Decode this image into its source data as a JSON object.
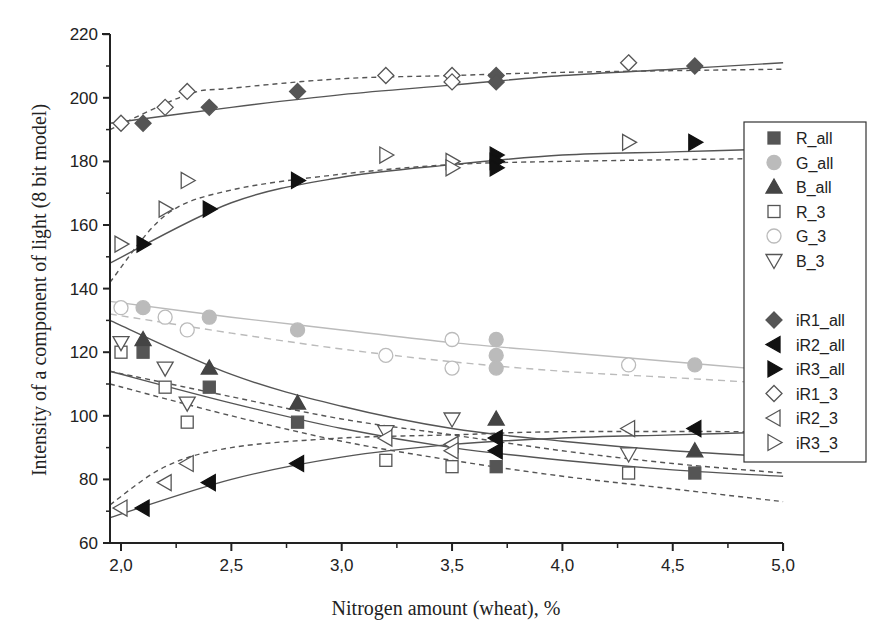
{
  "chart_data": {
    "type": "scatter",
    "title": "",
    "xlabel": "Nitrogen amount (wheat), %",
    "ylabel": "Intensity of a component of light (8 bit model)",
    "xlim": [
      1.95,
      5.0
    ],
    "ylim": [
      60,
      220
    ],
    "x_ticks": [
      "2,0",
      "2,5",
      "3,0",
      "3,5",
      "4,0",
      "4,5",
      "5,0"
    ],
    "x_tick_values": [
      2.0,
      2.5,
      3.0,
      3.5,
      4.0,
      4.5,
      5.0
    ],
    "y_ticks": [
      "60",
      "80",
      "100",
      "120",
      "140",
      "160",
      "180",
      "200",
      "220"
    ],
    "y_tick_values": [
      60,
      80,
      100,
      120,
      140,
      160,
      180,
      200,
      220
    ],
    "grid": false,
    "legend_position": "right",
    "series": [
      {
        "name": "R_all",
        "marker": "square-filled",
        "color": "#555555",
        "fit": "solid",
        "points": [
          [
            2.1,
            120
          ],
          [
            2.4,
            109
          ],
          [
            2.8,
            98
          ],
          [
            3.7,
            84
          ],
          [
            4.6,
            82
          ]
        ],
        "fit_curve": [
          [
            1.95,
            114
          ],
          [
            2.5,
            104
          ],
          [
            3.0,
            96
          ],
          [
            3.5,
            90
          ],
          [
            4.0,
            86
          ],
          [
            4.5,
            83
          ],
          [
            5.0,
            81
          ]
        ]
      },
      {
        "name": "G_all",
        "marker": "circle-filled",
        "color": "#bbbbbb",
        "fit": "solid-light",
        "points": [
          [
            2.1,
            134
          ],
          [
            2.4,
            131
          ],
          [
            2.8,
            127
          ],
          [
            3.7,
            124
          ],
          [
            3.7,
            119
          ],
          [
            3.7,
            115
          ],
          [
            4.6,
            116
          ]
        ],
        "fit_curve": [
          [
            1.95,
            136
          ],
          [
            2.5,
            131
          ],
          [
            3.0,
            127
          ],
          [
            3.5,
            123
          ],
          [
            4.0,
            120
          ],
          [
            4.5,
            117
          ],
          [
            5.0,
            114
          ]
        ]
      },
      {
        "name": "B_all",
        "marker": "triangle-up-filled",
        "color": "#444444",
        "fit": "solid",
        "points": [
          [
            2.1,
            124
          ],
          [
            2.4,
            115
          ],
          [
            2.8,
            104
          ],
          [
            3.7,
            99
          ],
          [
            4.6,
            89
          ]
        ],
        "fit_curve": [
          [
            1.95,
            130
          ],
          [
            2.5,
            113
          ],
          [
            3.0,
            103
          ],
          [
            3.5,
            96
          ],
          [
            4.0,
            92
          ],
          [
            4.5,
            89
          ],
          [
            5.0,
            87
          ]
        ]
      },
      {
        "name": "R_3",
        "marker": "square-open",
        "color": "#555555",
        "fit": "dashed",
        "points": [
          [
            2.0,
            120
          ],
          [
            2.2,
            109
          ],
          [
            2.3,
            98
          ],
          [
            3.2,
            86
          ],
          [
            3.5,
            84
          ],
          [
            4.3,
            82
          ]
        ],
        "fit_curve": [
          [
            1.95,
            110
          ],
          [
            2.5,
            100
          ],
          [
            3.0,
            92
          ],
          [
            3.5,
            86
          ],
          [
            4.0,
            81
          ],
          [
            4.5,
            77
          ],
          [
            5.0,
            73
          ]
        ]
      },
      {
        "name": "G_3",
        "marker": "circle-open",
        "color": "#bbbbbb",
        "fit": "dashed-light",
        "points": [
          [
            2.0,
            134
          ],
          [
            2.2,
            131
          ],
          [
            2.3,
            127
          ],
          [
            3.2,
            119
          ],
          [
            3.5,
            124
          ],
          [
            3.5,
            115
          ],
          [
            4.3,
            116
          ]
        ],
        "fit_curve": [
          [
            1.95,
            132
          ],
          [
            2.5,
            126
          ],
          [
            3.0,
            121
          ],
          [
            3.5,
            117
          ],
          [
            4.0,
            114
          ],
          [
            4.5,
            112
          ],
          [
            5.0,
            110
          ]
        ]
      },
      {
        "name": "B_3",
        "marker": "triangle-down-open",
        "color": "#555555",
        "fit": "dashed",
        "points": [
          [
            2.0,
            123
          ],
          [
            2.2,
            115
          ],
          [
            2.3,
            104
          ],
          [
            3.2,
            95
          ],
          [
            3.5,
            99
          ],
          [
            4.3,
            88
          ]
        ],
        "fit_curve": [
          [
            1.95,
            114
          ],
          [
            2.5,
            106
          ],
          [
            3.0,
            99
          ],
          [
            3.5,
            94
          ],
          [
            4.0,
            89
          ],
          [
            4.5,
            85
          ],
          [
            5.0,
            82
          ]
        ]
      },
      {
        "name": "iR1_all",
        "marker": "diamond-filled",
        "color": "#555555",
        "fit": "solid",
        "points": [
          [
            2.1,
            192
          ],
          [
            2.4,
            197
          ],
          [
            2.8,
            202
          ],
          [
            3.7,
            207
          ],
          [
            3.7,
            205
          ],
          [
            4.6,
            210
          ]
        ],
        "fit_curve": [
          [
            1.95,
            192
          ],
          [
            2.5,
            197
          ],
          [
            3.0,
            201
          ],
          [
            3.5,
            204
          ],
          [
            4.0,
            207
          ],
          [
            4.5,
            209
          ],
          [
            5.0,
            211
          ]
        ]
      },
      {
        "name": "iR2_all",
        "marker": "triangle-left-filled",
        "color": "#111111",
        "fit": "solid",
        "points": [
          [
            2.1,
            71
          ],
          [
            2.4,
            79
          ],
          [
            2.8,
            85
          ],
          [
            3.7,
            89
          ],
          [
            3.7,
            93
          ],
          [
            4.6,
            96
          ]
        ],
        "fit_curve": [
          [
            1.95,
            68
          ],
          [
            2.5,
            80
          ],
          [
            3.0,
            87
          ],
          [
            3.5,
            91
          ],
          [
            4.0,
            93
          ],
          [
            4.5,
            94
          ],
          [
            5.0,
            95
          ]
        ]
      },
      {
        "name": "iR3_all",
        "marker": "triangle-right-filled",
        "color": "#111111",
        "fit": "solid",
        "points": [
          [
            2.1,
            154
          ],
          [
            2.4,
            165
          ],
          [
            2.8,
            174
          ],
          [
            3.7,
            182
          ],
          [
            3.7,
            180
          ],
          [
            3.7,
            178
          ],
          [
            4.6,
            186
          ]
        ],
        "fit_curve": [
          [
            1.95,
            148
          ],
          [
            2.5,
            167
          ],
          [
            3.0,
            175
          ],
          [
            3.5,
            179
          ],
          [
            4.0,
            182
          ],
          [
            4.5,
            183
          ],
          [
            5.0,
            184
          ]
        ]
      },
      {
        "name": "iR1_3",
        "marker": "diamond-open",
        "color": "#555555",
        "fit": "dashed",
        "points": [
          [
            2.0,
            192
          ],
          [
            2.2,
            197
          ],
          [
            2.3,
            202
          ],
          [
            3.2,
            207
          ],
          [
            3.5,
            207
          ],
          [
            3.5,
            205
          ],
          [
            4.3,
            211
          ]
        ],
        "fit_curve": [
          [
            1.95,
            190
          ],
          [
            2.3,
            201
          ],
          [
            2.5,
            203
          ],
          [
            3.0,
            206
          ],
          [
            3.5,
            207
          ],
          [
            4.0,
            208
          ],
          [
            5.0,
            209
          ]
        ]
      },
      {
        "name": "iR2_3",
        "marker": "triangle-left-open",
        "color": "#555555",
        "fit": "dashed",
        "points": [
          [
            2.0,
            71
          ],
          [
            2.2,
            79
          ],
          [
            2.3,
            85
          ],
          [
            3.2,
            93
          ],
          [
            3.5,
            91
          ],
          [
            3.5,
            89
          ],
          [
            4.3,
            96
          ]
        ],
        "fit_curve": [
          [
            1.95,
            72
          ],
          [
            2.2,
            84
          ],
          [
            2.5,
            90
          ],
          [
            3.0,
            93
          ],
          [
            3.5,
            94
          ],
          [
            4.0,
            95
          ],
          [
            5.0,
            95
          ]
        ]
      },
      {
        "name": "iR3_3",
        "marker": "triangle-right-open",
        "color": "#555555",
        "fit": "dashed",
        "points": [
          [
            2.0,
            154
          ],
          [
            2.2,
            165
          ],
          [
            2.3,
            174
          ],
          [
            3.2,
            182
          ],
          [
            3.5,
            180
          ],
          [
            3.5,
            178
          ],
          [
            4.3,
            186
          ]
        ],
        "fit_curve": [
          [
            1.95,
            142
          ],
          [
            2.2,
            163
          ],
          [
            2.5,
            171
          ],
          [
            3.0,
            176
          ],
          [
            3.5,
            179
          ],
          [
            4.0,
            180
          ],
          [
            5.0,
            181
          ]
        ]
      }
    ]
  },
  "legend": {
    "group1": [
      "R_all",
      "G_all",
      "B_all",
      "R_3",
      "G_3",
      "B_3"
    ],
    "group2": [
      "iR1_all",
      "iR2_all",
      "iR3_all",
      "iR1_3",
      "iR2_3",
      "iR3_3"
    ]
  }
}
